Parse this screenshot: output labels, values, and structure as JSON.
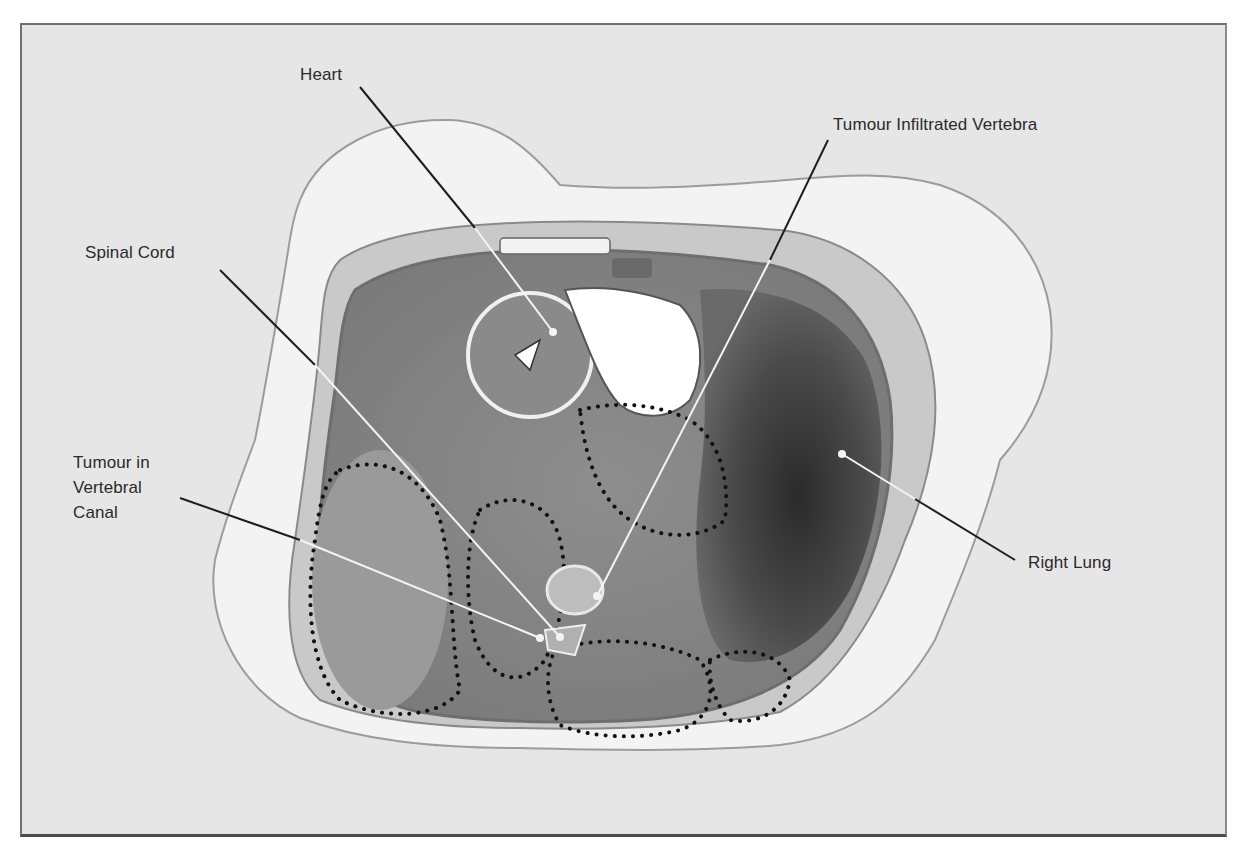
{
  "figure": {
    "background_color": "#e6e6e6",
    "frame_color": "#4a4a4a",
    "leader_dark_color": "#1e1e1e",
    "leader_light_color": "#f4f4f4",
    "tumour_outline_style": "dotted",
    "labels": [
      {
        "id": "heart",
        "text": "Heart"
      },
      {
        "id": "tumour-infiltrated-vertebra",
        "text": "Tumour Infiltrated Vertebra"
      },
      {
        "id": "spinal-cord",
        "text": "Spinal Cord"
      },
      {
        "id": "tumour-in-vertebral-canal",
        "text": "Tumour in\nVertebral\nCanal"
      },
      {
        "id": "right-lung",
        "text": "Right Lung"
      }
    ]
  }
}
